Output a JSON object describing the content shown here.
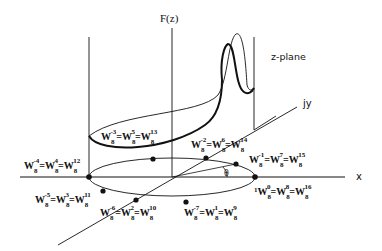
{
  "diagram": {
    "function_label": "F(z)",
    "plane_label": "z-plane",
    "x_axis_label": "x",
    "y_axis_label": "jy",
    "angle_label": "θ",
    "colors": {
      "ink": "#111111",
      "background": "#ffffff"
    },
    "roots": [
      {
        "id": "k0",
        "text": "1W8^0=W8^8=W8^16",
        "prefix": "1",
        "parts": [
          {
            "base": "W",
            "sub": "8",
            "sup": "0"
          },
          {
            "base": "W",
            "sub": "8",
            "sup": "8"
          },
          {
            "base": "W",
            "sub": "8",
            "sup": "16"
          }
        ]
      },
      {
        "id": "k15",
        "text": "W8^-1=W8^7=W8^15",
        "parts": [
          {
            "base": "W",
            "sub": "8",
            "sup": "-1"
          },
          {
            "base": "W",
            "sub": "8",
            "sup": "7"
          },
          {
            "base": "W",
            "sub": "8",
            "sup": "15"
          }
        ]
      },
      {
        "id": "k14",
        "text": "W8^-2=W8^6=W8^14",
        "parts": [
          {
            "base": "W",
            "sub": "8",
            "sup": "-2"
          },
          {
            "base": "W",
            "sub": "8",
            "sup": "6"
          },
          {
            "base": "W",
            "sub": "8",
            "sup": "14"
          }
        ]
      },
      {
        "id": "k13",
        "text": "W8^-3=W8^5=W8^13",
        "parts": [
          {
            "base": "W",
            "sub": "8",
            "sup": "-3"
          },
          {
            "base": "W",
            "sub": "8",
            "sup": "5"
          },
          {
            "base": "W",
            "sub": "8",
            "sup": "13"
          }
        ]
      },
      {
        "id": "k12",
        "text": "W8^-4=W8^4=W8^12",
        "parts": [
          {
            "base": "W",
            "sub": "8",
            "sup": "-4"
          },
          {
            "base": "W",
            "sub": "8",
            "sup": "4"
          },
          {
            "base": "W",
            "sub": "8",
            "sup": "12"
          }
        ]
      },
      {
        "id": "k11",
        "text": "W8^-5=W8^3=W8^11",
        "parts": [
          {
            "base": "W",
            "sub": "8",
            "sup": "-5"
          },
          {
            "base": "W",
            "sub": "8",
            "sup": "3"
          },
          {
            "base": "W",
            "sub": "8",
            "sup": "11"
          }
        ]
      },
      {
        "id": "k10",
        "text": "W8^-6=W8^2=W8^10",
        "parts": [
          {
            "base": "W",
            "sub": "8",
            "sup": "-6"
          },
          {
            "base": "W",
            "sub": "8",
            "sup": "2"
          },
          {
            "base": "W",
            "sub": "8",
            "sup": "10"
          }
        ]
      },
      {
        "id": "k9",
        "text": "W8^-7=W8^1=W8^9",
        "parts": [
          {
            "base": "W",
            "sub": "8",
            "sup": "-7"
          },
          {
            "base": "W",
            "sub": "8",
            "sup": "1"
          },
          {
            "base": "W",
            "sub": "8",
            "sup": "9"
          }
        ]
      }
    ]
  }
}
